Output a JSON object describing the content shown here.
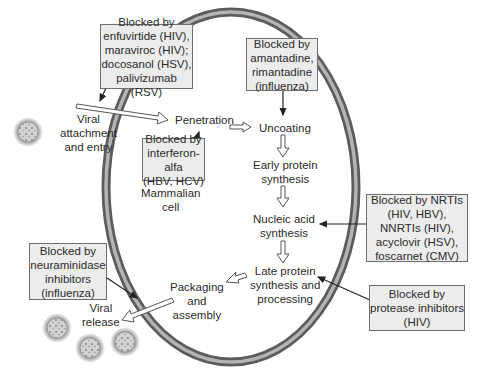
{
  "diagram": {
    "cell_label": [
      "Mammalian",
      "cell"
    ],
    "steps": {
      "attachment": [
        "Viral",
        "attachment",
        "and entry"
      ],
      "penetration": [
        "Penetration"
      ],
      "uncoating": [
        "Uncoating"
      ],
      "early_protein": [
        "Early protein",
        "synthesis"
      ],
      "nucleic_acid": [
        "Nucleic acid",
        "synthesis"
      ],
      "late_protein": [
        "Late protein",
        "synthesis and",
        "processing"
      ],
      "packaging": [
        "Packaging",
        "and",
        "assembly"
      ],
      "release": [
        "Viral",
        "release"
      ]
    },
    "blockers": {
      "attachment": [
        "Blocked by",
        "enfuvirtide (HIV),",
        "maraviroc (HIV);",
        "docosanol (HSV),",
        "palivizumab (RSV)"
      ],
      "uncoating": [
        "Blocked by",
        "amantadine,",
        "rimantadine",
        "(influenza)"
      ],
      "penetration": [
        "Blocked by",
        "interferon-alfa",
        "(HBV, HCV)"
      ],
      "nucleic_acid": [
        "Blocked by NRTIs",
        "(HIV, HBV),",
        "NNRTIs (HIV),",
        "acyclovir (HSV),",
        "foscarnet (CMV)"
      ],
      "late_protein": [
        "Blocked by",
        "protease inhibitors",
        "(HIV)"
      ],
      "release": [
        "Blocked by",
        "neuraminidase",
        "inhibitors",
        "(influenza)"
      ]
    },
    "colors": {
      "membrane_dark": "#5c5c5c",
      "membrane_light": "#b4b4b4",
      "box_fill": "#ececec",
      "box_border": "#6e6e6e",
      "virion_fill": "#c8c8c8",
      "virion_halo": "#8a8a8a"
    }
  }
}
